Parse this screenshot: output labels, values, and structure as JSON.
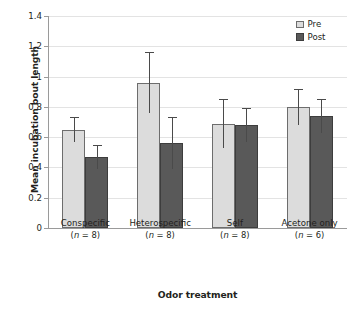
{
  "chart_data": {
    "type": "bar",
    "title": "",
    "xlabel": "Odor treatment",
    "ylabel": "Mean incubation bout length",
    "ylim": [
      0,
      1.4
    ],
    "ytick_labels": [
      "0",
      "0.2",
      "0.4",
      "0.6",
      "0.8",
      "1",
      "1.2",
      "1.4"
    ],
    "ytick_values": [
      0,
      0.2,
      0.4,
      0.6,
      0.8,
      1.0,
      1.2,
      1.4
    ],
    "grid": true,
    "legend_position": "top-right",
    "categories": [
      "Conspecific",
      "Heterospecific",
      "Self",
      "Acetone only"
    ],
    "category_sublabels": [
      "(n = 8)",
      "(n = 8)",
      "(n = 8)",
      "(n = 6)"
    ],
    "sample_sizes": [
      8,
      8,
      8,
      6
    ],
    "series": [
      {
        "name": "Pre",
        "color": "#dcdcdc",
        "values": [
          0.65,
          0.96,
          0.69,
          0.8
        ],
        "errors": [
          0.08,
          0.2,
          0.16,
          0.12
        ]
      },
      {
        "name": "Post",
        "color": "#595959",
        "values": [
          0.47,
          0.56,
          0.68,
          0.74
        ],
        "errors": [
          0.08,
          0.17,
          0.11,
          0.11
        ]
      }
    ]
  },
  "legend": {
    "entries": [
      {
        "label": "Pre",
        "swatch": "pre"
      },
      {
        "label": "Post",
        "swatch": "post"
      }
    ]
  }
}
